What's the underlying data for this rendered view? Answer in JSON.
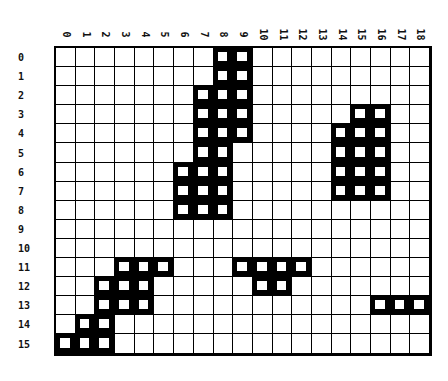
{
  "grid": {
    "columns": [
      "0",
      "1",
      "2",
      "3",
      "4",
      "5",
      "6",
      "7",
      "8",
      "9",
      "10",
      "11",
      "12",
      "13",
      "14",
      "15",
      "16",
      "17",
      "18"
    ],
    "rows": [
      "0",
      "1",
      "2",
      "3",
      "4",
      "5",
      "6",
      "7",
      "8",
      "9",
      "10",
      "11",
      "12",
      "13",
      "14",
      "15"
    ],
    "filled": {
      "0": [
        8,
        9
      ],
      "1": [
        8,
        9
      ],
      "2": [
        7,
        8,
        9
      ],
      "3": [
        7,
        8,
        9,
        15,
        16
      ],
      "4": [
        7,
        8,
        9,
        14,
        15,
        16
      ],
      "5": [
        7,
        8,
        14,
        15,
        16
      ],
      "6": [
        6,
        7,
        8,
        14,
        15,
        16
      ],
      "7": [
        6,
        7,
        8,
        14,
        15,
        16
      ],
      "8": [
        6,
        7,
        8
      ],
      "9": [],
      "10": [],
      "11": [
        3,
        4,
        5,
        9,
        10,
        11,
        12
      ],
      "12": [
        2,
        3,
        4,
        10,
        11
      ],
      "13": [
        2,
        3,
        4,
        16,
        17,
        18
      ],
      "14": [
        1,
        2
      ],
      "15": [
        0,
        1,
        2
      ]
    },
    "colors": {
      "filled": "#000000",
      "empty": "#ffffff",
      "line": "#000000"
    }
  }
}
